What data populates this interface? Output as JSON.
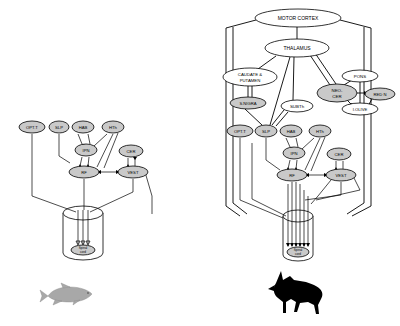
{
  "figure": {
    "background_color": "#ffffff",
    "node_fill_color": "#c9c9c9",
    "node_stroke_color": "#000000",
    "line_color": "#000000",
    "fish_silhouette_color": "#a8a8a8",
    "dog_silhouette_color": "#000000"
  },
  "panels": [
    {
      "id": "fish-panel",
      "organism": "fish",
      "spinal_cord_label_line1": "Spinal",
      "spinal_cord_label_line2": "cord",
      "nodes": [
        {
          "id": "optt",
          "label": "OPT.T",
          "x": 32,
          "y": 127,
          "rx": 13,
          "ry": 6
        },
        {
          "id": "slp",
          "label": "SLP",
          "x": 59,
          "y": 127,
          "rx": 10,
          "ry": 6
        },
        {
          "id": "hab",
          "label": "HAB",
          "x": 83,
          "y": 127,
          "rx": 11,
          "ry": 6
        },
        {
          "id": "hth",
          "label": "HTh",
          "x": 113,
          "y": 127,
          "rx": 11,
          "ry": 6
        },
        {
          "id": "ipn",
          "label": "IPN",
          "x": 86,
          "y": 150,
          "rx": 11,
          "ry": 6
        },
        {
          "id": "cer",
          "label": "CER",
          "x": 131,
          "y": 151,
          "rx": 12,
          "ry": 6
        },
        {
          "id": "rf",
          "label": "RF",
          "x": 84,
          "y": 172,
          "rx": 15,
          "ry": 6
        },
        {
          "id": "vest",
          "label": "VEST",
          "x": 133,
          "y": 172,
          "rx": 15,
          "ry": 6
        }
      ],
      "edges": [
        {
          "from": "optt",
          "to": "cord"
        },
        {
          "from": "slp",
          "to": "rf"
        },
        {
          "from": "hab",
          "to": "ipn"
        },
        {
          "from": "hth",
          "to": "ipn"
        },
        {
          "from": "hth",
          "to": "rf"
        },
        {
          "from": "ipn",
          "to": "rf"
        },
        {
          "from": "cer",
          "to": "vest"
        },
        {
          "from": "rf",
          "to": "vest"
        },
        {
          "from": "rf",
          "to": "cord"
        },
        {
          "from": "vest",
          "to": "cord"
        }
      ]
    },
    {
      "id": "mammal-panel",
      "organism": "dog",
      "spinal_cord_label_line1": "Spinal",
      "spinal_cord_label_line2": "cord",
      "nodes": [
        {
          "id": "motor",
          "label": "MOTOR CORTEX",
          "x": 298,
          "y": 18,
          "rx": 43,
          "ry": 9
        },
        {
          "id": "thal",
          "label": "THALAMUS",
          "x": 297,
          "y": 48,
          "rx": 32,
          "ry": 9
        },
        {
          "id": "caudput",
          "label": "CAUDATE & PUTAMEN",
          "x": 250,
          "y": 77,
          "rx": 27,
          "ry": 9
        },
        {
          "id": "snigra",
          "label": "S.NIGRA",
          "x": 248,
          "y": 103,
          "rx": 18,
          "ry": 6
        },
        {
          "id": "subth",
          "label": "SUBTh",
          "x": 297,
          "y": 106,
          "rx": 16,
          "ry": 6
        },
        {
          "id": "neocer",
          "label": "NEO-CER",
          "x": 337,
          "y": 93,
          "rx": 20,
          "ry": 9
        },
        {
          "id": "pons",
          "label": "PONS",
          "x": 360,
          "y": 76,
          "rx": 18,
          "ry": 6
        },
        {
          "id": "redn",
          "label": "RED N",
          "x": 380,
          "y": 94,
          "rx": 15,
          "ry": 6
        },
        {
          "id": "iolive",
          "label": "I.OLIVE",
          "x": 360,
          "y": 109,
          "rx": 18,
          "ry": 6
        },
        {
          "id": "optt2",
          "label": "OPT.T",
          "x": 240,
          "y": 131,
          "rx": 13,
          "ry": 6
        },
        {
          "id": "slp2",
          "label": "SLP",
          "x": 266,
          "y": 131,
          "rx": 11,
          "ry": 6
        },
        {
          "id": "hab2",
          "label": "HAB",
          "x": 291,
          "y": 131,
          "rx": 11,
          "ry": 6
        },
        {
          "id": "hth2",
          "label": "HTh",
          "x": 320,
          "y": 131,
          "rx": 11,
          "ry": 6
        },
        {
          "id": "ipn2",
          "label": "IPN",
          "x": 294,
          "y": 153,
          "rx": 11,
          "ry": 6
        },
        {
          "id": "cer2",
          "label": "CER",
          "x": 339,
          "y": 154,
          "rx": 12,
          "ry": 6
        },
        {
          "id": "rf2",
          "label": "RF",
          "x": 292,
          "y": 175,
          "rx": 15,
          "ry": 6
        },
        {
          "id": "vest2",
          "label": "VEST",
          "x": 341,
          "y": 175,
          "rx": 15,
          "ry": 6
        }
      ],
      "edges": [
        {
          "from": "motor",
          "to": "thal"
        },
        {
          "from": "motor",
          "to": "left-tract"
        },
        {
          "from": "motor",
          "to": "right-tract"
        },
        {
          "from": "thal",
          "to": "caudput"
        },
        {
          "from": "thal",
          "to": "slp2"
        },
        {
          "from": "thal",
          "to": "subth"
        },
        {
          "from": "thal",
          "to": "neocer"
        },
        {
          "from": "caudput",
          "to": "snigra"
        },
        {
          "from": "snigra",
          "to": "slp2"
        },
        {
          "from": "subth",
          "to": "slp2"
        },
        {
          "from": "neocer",
          "to": "pons"
        },
        {
          "from": "neocer",
          "to": "redn"
        },
        {
          "from": "neocer",
          "to": "iolive"
        },
        {
          "from": "redn",
          "to": "iolive"
        },
        {
          "from": "hab2",
          "to": "ipn2"
        },
        {
          "from": "hth2",
          "to": "ipn2"
        },
        {
          "from": "hth2",
          "to": "rf2"
        },
        {
          "from": "ipn2",
          "to": "rf2"
        },
        {
          "from": "cer2",
          "to": "vest2"
        },
        {
          "from": "rf2",
          "to": "vest2"
        },
        {
          "from": "optt2",
          "to": "cord2"
        },
        {
          "from": "slp2",
          "to": "cord2"
        },
        {
          "from": "rf2",
          "to": "cord2"
        },
        {
          "from": "vest2",
          "to": "cord2"
        }
      ]
    }
  ]
}
